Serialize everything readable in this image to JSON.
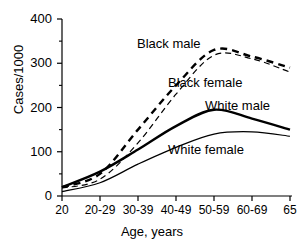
{
  "chart_data": {
    "type": "line",
    "title": "",
    "subtitle": "",
    "xlabel": "Age, years",
    "ylabel": "Cases/1000",
    "categories": [
      "20",
      "20-29",
      "30-39",
      "40-49",
      "50-59",
      "60-69",
      "65"
    ],
    "ylim": [
      0,
      400
    ],
    "y_ticks": [
      0,
      100,
      200,
      300,
      400
    ],
    "y_tick_labels": [
      "0",
      "100",
      "200",
      "300",
      "400"
    ],
    "y_minor_ticks": [
      50,
      150,
      250,
      350
    ],
    "grid": false,
    "legend_position": "inline-annotations",
    "series": [
      {
        "name": "Black male",
        "style": "dashed",
        "width": "thick",
        "color": "#000000",
        "values": [
          20,
          50,
          150,
          250,
          330,
          315,
          290
        ]
      },
      {
        "name": "Black female",
        "style": "dashed",
        "width": "thin",
        "color": "#000000",
        "values": [
          18,
          38,
          120,
          230,
          318,
          310,
          280
        ]
      },
      {
        "name": "White male",
        "style": "solid",
        "width": "thick",
        "color": "#000000",
        "values": [
          20,
          55,
          105,
          158,
          195,
          175,
          150
        ]
      },
      {
        "name": "White female",
        "style": "solid",
        "width": "thin",
        "color": "#000000",
        "values": [
          10,
          30,
          72,
          110,
          140,
          145,
          135
        ]
      }
    ],
    "annotations": [
      {
        "text": "Black male",
        "x_px": 137,
        "y_px": 36
      },
      {
        "text": "Black female",
        "x_px": 168,
        "y_px": 75
      },
      {
        "text": "White male",
        "x_px": 205,
        "y_px": 98
      },
      {
        "text": "White female",
        "x_px": 168,
        "y_px": 142
      }
    ]
  },
  "axis": {
    "y_title": "Cases/1000",
    "x_title": "Age, years"
  }
}
